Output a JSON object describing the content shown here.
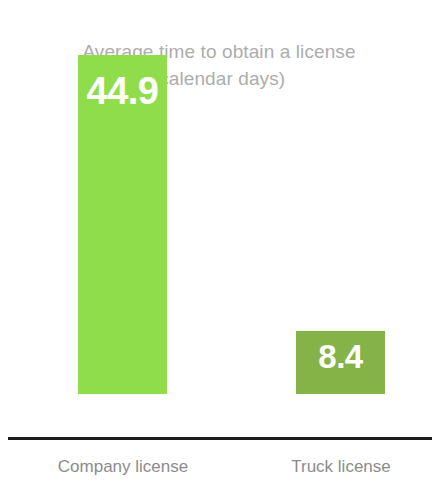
{
  "chart_data": {
    "type": "bar",
    "title": "Average time to obtain a license",
    "subtitle": "(calendar days)",
    "xlabel": "",
    "ylabel": "",
    "ylim": [
      0,
      44.9
    ],
    "grid": false,
    "legend": false,
    "categories": [
      "Company license",
      "Truck license"
    ],
    "values": [
      44.9,
      8.4
    ],
    "value_labels": [
      "44.9",
      "8.4"
    ],
    "bar_colors": [
      "#90DD4C",
      "#86B347"
    ],
    "axis_color": "#1C1C1C",
    "title_color": "#ADADAD",
    "label_color": "#8C8C8C",
    "value_label_color": "#FFFFFF",
    "background": "#FFFFFF"
  }
}
